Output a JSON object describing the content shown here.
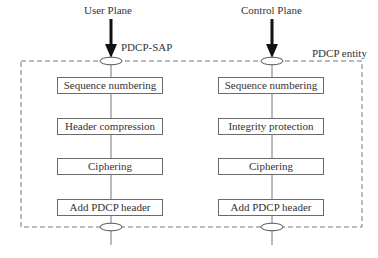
{
  "diagram": {
    "entity_label": "PDCP entity",
    "sap_label": "PDCP-SAP",
    "columns": [
      {
        "title": "User Plane",
        "boxes": [
          "Sequence numbering",
          "Header compression",
          "Ciphering",
          "Add PDCP header"
        ]
      },
      {
        "title": "Control Plane",
        "boxes": [
          "Sequence numbering",
          "Integrity protection",
          "Ciphering",
          "Add PDCP header"
        ]
      }
    ]
  }
}
